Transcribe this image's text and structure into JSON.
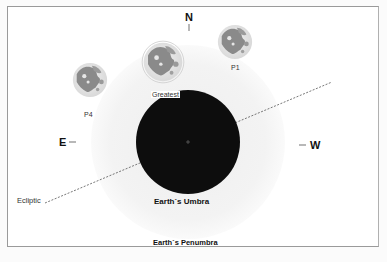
{
  "diagram": {
    "directions": {
      "north": "N",
      "east": "E",
      "west": "W"
    },
    "moon_positions": [
      {
        "id": "P1",
        "label": "P1"
      },
      {
        "id": "greatest",
        "label": "Greatest"
      },
      {
        "id": "P4",
        "label": "P4"
      }
    ],
    "shadow": {
      "umbra_label": "Earth`s Umbra",
      "penumbra_label": "Earth`s Penumbra"
    },
    "ecliptic_label": "Ecliptic",
    "colors": {
      "umbra": "#0d0d0d",
      "penumbra": "#f3f3f3",
      "moon_light": "#e8e8e8",
      "moon_dark": "#8a8a8a",
      "ecliptic": "#555555",
      "frame": "#9a9a9a"
    }
  }
}
